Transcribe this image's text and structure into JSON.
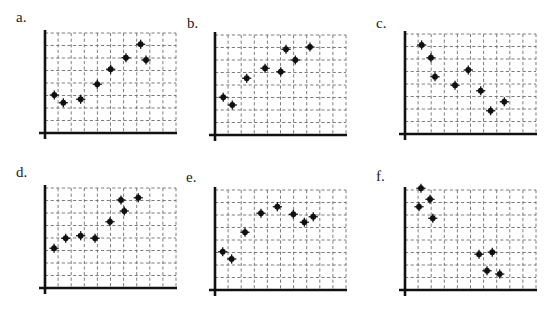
{
  "panels": [
    {
      "label": "a."
    },
    {
      "label": "b."
    },
    {
      "label": "c."
    },
    {
      "label": "d."
    },
    {
      "label": "e."
    },
    {
      "label": "f."
    }
  ],
  "chart_data": [
    {
      "type": "scatter",
      "title": "a.",
      "xlabel": "",
      "ylabel": "",
      "grid": true,
      "xlim": [
        0,
        10
      ],
      "ylim": [
        0,
        8
      ],
      "trend": "positive",
      "series": [
        {
          "name": "a",
          "points": [
            [
              0.71,
              3.04
            ],
            [
              1.4,
              2.42
            ],
            [
              2.72,
              2.7
            ],
            [
              3.99,
              3.9
            ],
            [
              5.01,
              5.1
            ],
            [
              6.18,
              6.02
            ],
            [
              7.3,
              7.1
            ],
            [
              7.71,
              5.84
            ]
          ]
        }
      ]
    },
    {
      "type": "scatter",
      "title": "b.",
      "xlabel": "",
      "ylabel": "",
      "grid": true,
      "xlim": [
        0,
        10
      ],
      "ylim": [
        0,
        8
      ],
      "trend": "positive",
      "series": [
        {
          "name": "b",
          "points": [
            [
              0.63,
              3.02
            ],
            [
              1.32,
              2.4
            ],
            [
              2.42,
              4.54
            ],
            [
              3.82,
              5.34
            ],
            [
              5.02,
              5.06
            ],
            [
              5.42,
              6.86
            ],
            [
              6.13,
              6.0
            ],
            [
              7.25,
              7.04
            ]
          ]
        }
      ]
    },
    {
      "type": "scatter",
      "title": "c.",
      "xlabel": "",
      "ylabel": "",
      "grid": true,
      "xlim": [
        0,
        10
      ],
      "ylim": [
        0,
        8
      ],
      "trend": "negative",
      "series": [
        {
          "name": "c",
          "points": [
            [
              1.27,
              7.12
            ],
            [
              1.98,
              6.1
            ],
            [
              2.29,
              4.58
            ],
            [
              3.82,
              3.9
            ],
            [
              4.83,
              5.12
            ],
            [
              5.78,
              3.46
            ],
            [
              6.54,
              1.86
            ],
            [
              7.58,
              2.58
            ]
          ]
        }
      ]
    },
    {
      "type": "scatter",
      "title": "d.",
      "xlabel": "",
      "ylabel": "",
      "grid": true,
      "xlim": [
        0,
        10
      ],
      "ylim": [
        0,
        8
      ],
      "trend": "positive",
      "series": [
        {
          "name": "d",
          "points": [
            [
              0.69,
              3.18
            ],
            [
              1.58,
              3.98
            ],
            [
              2.72,
              4.18
            ],
            [
              3.82,
              3.98
            ],
            [
              4.96,
              5.3
            ],
            [
              5.8,
              7.04
            ],
            [
              6.05,
              6.16
            ],
            [
              7.12,
              7.22
            ]
          ]
        }
      ]
    },
    {
      "type": "scatter",
      "title": "e.",
      "xlabel": "",
      "ylabel": "",
      "grid": true,
      "xlim": [
        0,
        10
      ],
      "ylim": [
        0,
        8
      ],
      "trend": "curvilinear (rise then level)",
      "series": [
        {
          "name": "e",
          "points": [
            [
              0.59,
              3.06
            ],
            [
              1.27,
              2.48
            ],
            [
              2.29,
              4.62
            ],
            [
              3.51,
              6.14
            ],
            [
              4.76,
              6.66
            ],
            [
              5.98,
              6.06
            ],
            [
              6.82,
              5.42
            ],
            [
              7.5,
              5.86
            ]
          ]
        }
      ]
    },
    {
      "type": "scatter",
      "title": "f.",
      "xlabel": "",
      "ylabel": "",
      "grid": true,
      "xlim": [
        0,
        10
      ],
      "ylim": [
        0,
        8
      ],
      "trend": "negative (two clusters)",
      "series": [
        {
          "name": "f",
          "points": [
            [
              1.22,
              8.14
            ],
            [
              1.91,
              7.26
            ],
            [
              1.07,
              6.66
            ],
            [
              2.12,
              5.74
            ],
            [
              5.65,
              2.86
            ],
            [
              6.66,
              3.02
            ],
            [
              6.26,
              1.54
            ],
            [
              7.23,
              1.28
            ]
          ]
        }
      ]
    }
  ],
  "layout": {
    "panels": [
      {
        "labelX": 16,
        "labelY": 10,
        "originX": 45,
        "originY": 133,
        "axisTopY": 30
      },
      {
        "labelX": 187,
        "labelY": 16,
        "originX": 215,
        "originY": 135,
        "axisTopY": 32
      },
      {
        "labelX": 376,
        "labelY": 16,
        "originX": 405,
        "originY": 134,
        "axisTopY": 31
      },
      {
        "labelX": 16,
        "labelY": 165,
        "originX": 45,
        "originY": 288,
        "axisTopY": 180
      },
      {
        "labelX": 186,
        "labelY": 170,
        "originX": 215,
        "originY": 290,
        "axisTopY": 184
      },
      {
        "labelX": 376,
        "labelY": 169,
        "originX": 405,
        "originY": 290,
        "axisTopY": 184
      }
    ],
    "cellW": 13.1,
    "cellH": 12.5,
    "cols": 10,
    "rows": 8
  },
  "colors": {
    "axis": "#111111",
    "grid": "#6e6e6e",
    "point": "#111111"
  }
}
